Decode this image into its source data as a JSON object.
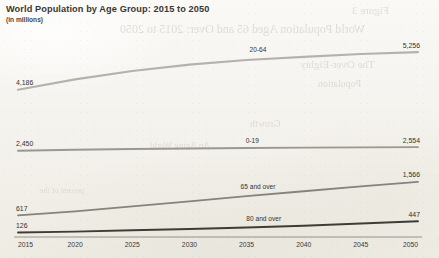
{
  "chart_data": {
    "type": "line",
    "title": "World Population by Age Group: 2015 to 2050",
    "subtitle": "(in millions)",
    "xlabel": "",
    "ylabel": "",
    "x": [
      2015,
      2020,
      2025,
      2030,
      2035,
      2040,
      2045,
      2050
    ],
    "tick_labels": [
      "2015",
      "2020",
      "2025",
      "2030",
      "2035",
      "2040",
      "2045",
      "2050"
    ],
    "xlim": [
      2015,
      2050
    ],
    "ylim": [
      0,
      5600
    ],
    "grid": false,
    "legend": "inline-series-labels",
    "series": [
      {
        "name": "20-64",
        "label": "20-64",
        "values": [
          4186,
          4480,
          4720,
          4900,
          5030,
          5120,
          5200,
          5256
        ],
        "start_label": "4,186",
        "end_label": "5,256",
        "color": "#b5b2ad"
      },
      {
        "name": "0-19",
        "label": "0-19",
        "values": [
          2450,
          2480,
          2500,
          2515,
          2528,
          2540,
          2548,
          2554
        ],
        "start_label": "2,450",
        "end_label": "2,554",
        "color": "#9b9791"
      },
      {
        "name": "65 and over",
        "label": "65 and over",
        "values": [
          617,
          730,
          870,
          1010,
          1160,
          1300,
          1440,
          1566
        ],
        "start_label": "617",
        "end_label": "1,566",
        "color": "#86827c"
      },
      {
        "name": "80 and over",
        "label": "80 and over",
        "values": [
          126,
          154,
          190,
          228,
          268,
          320,
          382,
          447
        ],
        "start_label": "126",
        "end_label": "447",
        "color": "#3f3c38"
      }
    ]
  },
  "ghost_text": [
    {
      "text": "Figure 3",
      "x": 352,
      "y": 4,
      "size": 11
    },
    {
      "text": "World Population Aged 65 and Over: 2015 to 2050",
      "x": 120,
      "y": 22,
      "size": 12
    },
    {
      "text": "The Over-Eighty",
      "x": 300,
      "y": 58,
      "size": 11
    },
    {
      "text": "Population",
      "x": 318,
      "y": 78,
      "size": 10
    },
    {
      "text": "Growth",
      "x": 250,
      "y": 118,
      "size": 10
    },
    {
      "text": "percent of the",
      "x": 40,
      "y": 186,
      "size": 8
    },
    {
      "text": "An Aging World",
      "x": 150,
      "y": 140,
      "size": 9
    }
  ]
}
